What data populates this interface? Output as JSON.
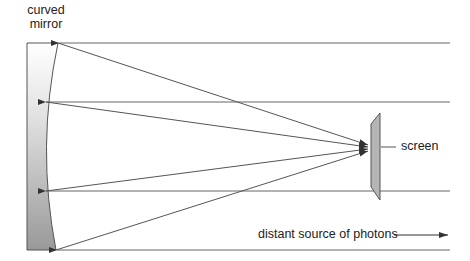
{
  "diagram": {
    "labels": {
      "mirror_line1": "curved",
      "mirror_line2": "mirror",
      "screen": "screen",
      "source": "distant source of photons"
    },
    "colors": {
      "line": "#555555",
      "mirror_top": "#ffffff",
      "mirror_bottom": "#9a9a9a",
      "screen_fill": "#b5b5b5",
      "text": "#222222"
    },
    "elements": {
      "mirror": {
        "type": "curved-mirror",
        "left_x": 27,
        "top_y": 43,
        "bottom_y": 250
      },
      "screen": {
        "type": "parallelogram",
        "x_left": 371,
        "x_right": 380
      },
      "incoming_rays": [
        43,
        102,
        191,
        250
      ],
      "focus_point": [
        370,
        147
      ],
      "direction_arrow": "right-arrow"
    }
  }
}
